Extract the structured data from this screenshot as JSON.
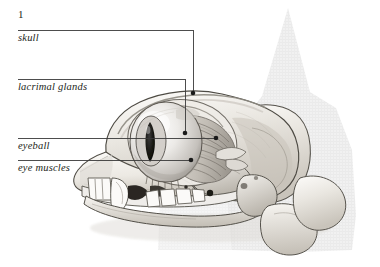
{
  "figure": {
    "number": "1"
  },
  "labels": [
    {
      "id": "number",
      "text": "1",
      "kind": "figure-number",
      "x": 18,
      "y": 8
    },
    {
      "id": "skull",
      "text": "skull",
      "kind": "structure-label",
      "x": 18,
      "y": 32,
      "leader": {
        "x1": 18,
        "y1": 30,
        "x2": 193,
        "y2": 30,
        "x3": 193,
        "y3": 93
      }
    },
    {
      "id": "lacrimal-glands",
      "text": "lacrimal glands",
      "kind": "structure-label",
      "x": 18,
      "y": 81,
      "leader": {
        "x1": 18,
        "y1": 79,
        "x2": 185,
        "y2": 79,
        "x3": 185,
        "y3": 133
      }
    },
    {
      "id": "eyeball",
      "text": "eyeball",
      "kind": "structure-label",
      "x": 18,
      "y": 140,
      "leader": {
        "x1": 18,
        "y1": 138,
        "x2": 216,
        "y2": 138
      }
    },
    {
      "id": "eye-muscles",
      "text": "eye muscles",
      "kind": "structure-label",
      "x": 18,
      "y": 162,
      "leader": {
        "x1": 18,
        "y1": 160,
        "x2": 191,
        "y2": 160
      }
    }
  ],
  "colors": {
    "background": "#ffffff",
    "ink": "#231f20",
    "leader_line": "#3a3a3a",
    "bone_light": "#f3f1ee",
    "bone_mid": "#d8d4cd",
    "bone_shadow": "#a9a49c",
    "bone_outline": "#4a4740",
    "silhouette": "#ededed",
    "eye_dark": "#1c1c1c",
    "tooth_white": "#fbfbf9"
  }
}
